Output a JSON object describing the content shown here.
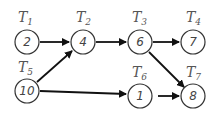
{
  "diagram": {
    "type": "task-dependency-graph",
    "nodes": [
      {
        "id": "T1",
        "label": "T",
        "sub": "1",
        "value": "2",
        "x": 27,
        "y": 42
      },
      {
        "id": "T2",
        "label": "T",
        "sub": "2",
        "value": "4",
        "x": 83,
        "y": 42
      },
      {
        "id": "T3",
        "label": "T",
        "sub": "3",
        "value": "6",
        "x": 140,
        "y": 42
      },
      {
        "id": "T4",
        "label": "T",
        "sub": "4",
        "value": "7",
        "x": 193,
        "y": 42
      },
      {
        "id": "T5",
        "label": "T",
        "sub": "5",
        "value": "10",
        "x": 27,
        "y": 91
      },
      {
        "id": "T6",
        "label": "T",
        "sub": "6",
        "value": "1",
        "x": 140,
        "y": 96
      },
      {
        "id": "T7",
        "label": "T",
        "sub": "7",
        "value": "8",
        "x": 193,
        "y": 96
      }
    ],
    "edges": [
      {
        "from": "T1",
        "to": "T2"
      },
      {
        "from": "T5",
        "to": "T2"
      },
      {
        "from": "T2",
        "to": "T3"
      },
      {
        "from": "T3",
        "to": "T4"
      },
      {
        "from": "T3",
        "to": "T7"
      },
      {
        "from": "T5",
        "to": "T6"
      },
      {
        "from": "T6",
        "to": "T7"
      }
    ],
    "colors": {
      "stroke": "#333333",
      "edge": "#111111",
      "text": "#444444"
    }
  }
}
